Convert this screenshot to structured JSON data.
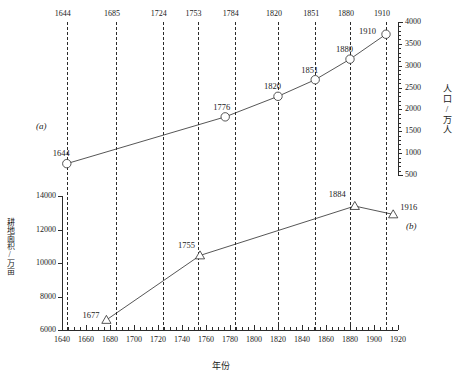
{
  "figure": {
    "panel_a_label": "(a)",
    "panel_b_label": "(b)",
    "xlabel": "年份",
    "ylabel_a": "人口/万人",
    "ylabel_b": "耕地面积/万亩"
  },
  "reference_years": [
    1644,
    1685,
    1724,
    1753,
    1784,
    1820,
    1851,
    1880,
    1910
  ],
  "axis_a_ticks": [
    "4000",
    "3500",
    "3000",
    "2500",
    "2000",
    "1500",
    "1000",
    "500"
  ],
  "axis_b_ticks": [
    "14000",
    "12000",
    "10000",
    "8000",
    "6000"
  ],
  "axis_x_ticks": [
    "1640",
    "1660",
    "1680",
    "1700",
    "1720",
    "1740",
    "1760",
    "1780",
    "1800",
    "1820",
    "1840",
    "1860",
    "1880",
    "1900",
    "1920"
  ],
  "chart_data": [
    {
      "type": "line",
      "panel": "(a)",
      "title": "",
      "xlabel": "年份",
      "ylabel": "人口/万人",
      "xlim": [
        1640,
        1920
      ],
      "ylim": [
        500,
        4000
      ],
      "grid": "vertical dashed reference lines at labeled years",
      "marker": "open-circle",
      "point_labels": [
        "1644",
        "1776",
        "1820",
        "1851",
        "1880",
        "1910"
      ],
      "x": [
        1644,
        1776,
        1820,
        1851,
        1880,
        1910
      ],
      "values": [
        760,
        1830,
        2300,
        2680,
        3150,
        3720
      ]
    },
    {
      "type": "line",
      "panel": "(b)",
      "title": "",
      "xlabel": "年份",
      "ylabel": "耕地面积/万亩",
      "xlim": [
        1640,
        1920
      ],
      "ylim": [
        6000,
        14000
      ],
      "grid": "vertical dashed reference lines at labeled years",
      "marker": "open-triangle",
      "point_labels": [
        "1677",
        "1755",
        "1884",
        "1916"
      ],
      "x": [
        1677,
        1755,
        1884,
        1916
      ],
      "values": [
        6600,
        10450,
        13400,
        12900
      ]
    }
  ]
}
